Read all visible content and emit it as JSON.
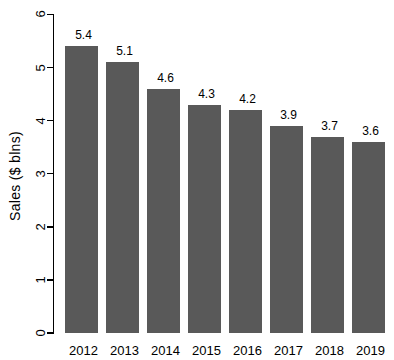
{
  "chart_data": {
    "type": "bar",
    "title": "",
    "categories": [
      "2012",
      "2013",
      "2014",
      "2015",
      "2016",
      "2017",
      "2018",
      "2019"
    ],
    "values": [
      5.4,
      5.1,
      4.6,
      4.3,
      4.2,
      3.9,
      3.7,
      3.6
    ],
    "bar_labels": [
      "5.4",
      "5.1",
      "4.6",
      "4.3",
      "4.2",
      "3.9",
      "3.7",
      "3.6"
    ],
    "xlabel": "",
    "ylabel": "Sales ($ blns)",
    "ylim": [
      0,
      6
    ],
    "yticks": [
      0,
      1,
      2,
      3,
      4,
      5,
      6
    ],
    "grid": false,
    "legend": null,
    "colors": {
      "bar": "#595959",
      "axis": "#000000",
      "text": "#000000",
      "background": "#ffffff"
    }
  }
}
